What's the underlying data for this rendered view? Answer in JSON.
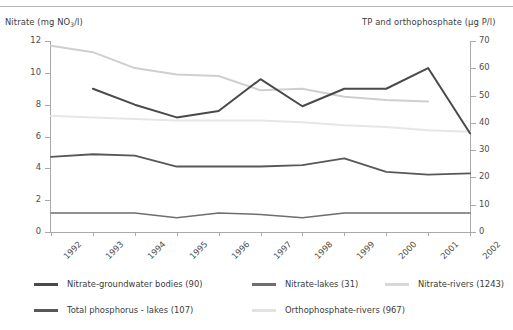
{
  "chart_data": {
    "type": "line",
    "title": "",
    "xlabel": "",
    "ylabel": "Nitrate (mg NO3/l)",
    "y2label": "TP and orthophosphate (µg P/l)",
    "grid": false,
    "legend_position": "bottom",
    "x": [
      1992,
      1993,
      1994,
      1995,
      1996,
      1997,
      1998,
      1999,
      2000,
      2001,
      2002
    ],
    "categories": [
      "1992",
      "1993",
      "1994",
      "1995",
      "1996",
      "1997",
      "1998",
      "1999",
      "2000",
      "2001",
      "2002"
    ],
    "ylim": [
      0,
      12
    ],
    "yticks": [
      0,
      2,
      4,
      6,
      8,
      10,
      12
    ],
    "yticklabels": [
      "0",
      "2",
      "4",
      "6",
      "8",
      "10",
      "12"
    ],
    "y2lim": [
      0,
      70
    ],
    "y2ticks": [
      0,
      10,
      20,
      30,
      40,
      50,
      60,
      70
    ],
    "y2ticklabels": [
      "0",
      "10",
      "20",
      "30",
      "40",
      "50",
      "60",
      "70"
    ],
    "series": [
      {
        "name": "Nitrate-groundwater bodies (90)",
        "axis": "left",
        "color": "#4a4a4a",
        "width": 2.0,
        "x": [
          1993,
          1994,
          1995,
          1996,
          1997,
          1998,
          1999,
          2000,
          2001,
          2002
        ],
        "values": [
          9.0,
          8.0,
          7.2,
          7.6,
          9.6,
          7.9,
          9.0,
          9.0,
          10.3,
          6.2
        ]
      },
      {
        "name": "Nitrate-lakes (31)",
        "axis": "left",
        "color": "#6e6e6e",
        "width": 1.5,
        "x": [
          1992,
          1993,
          1994,
          1995,
          1996,
          1997,
          1998,
          1999,
          2000,
          2001,
          2002
        ],
        "values": [
          1.2,
          1.2,
          1.2,
          0.9,
          1.2,
          1.1,
          0.9,
          1.2,
          1.2,
          1.2,
          1.2
        ]
      },
      {
        "name": "Nitrate-rivers (1243)",
        "axis": "left",
        "color": "#cfcfcf",
        "width": 2.0,
        "x": [
          1992,
          1993,
          1994,
          1995,
          1996,
          1997,
          1998,
          1999,
          2000,
          2001
        ],
        "values": [
          11.7,
          11.3,
          10.3,
          9.9,
          9.8,
          8.9,
          9.0,
          8.5,
          8.3,
          8.2
        ]
      },
      {
        "name": "Total phosphorus - lakes (107)",
        "axis": "right",
        "color": "#585858",
        "width": 1.8,
        "x": [
          1992,
          1993,
          1994,
          1995,
          1996,
          1997,
          1998,
          1999,
          2000,
          2001,
          2002
        ],
        "values": [
          27.5,
          28.5,
          28.0,
          24.0,
          24.0,
          24.0,
          24.5,
          27.0,
          22.0,
          21.0,
          21.5
        ]
      },
      {
        "name": "Orthophosphate-rivers (967)",
        "axis": "left",
        "color": "#e6e6e6",
        "width": 2.0,
        "x": [
          1992,
          1993,
          1994,
          1995,
          1996,
          1997,
          1998,
          1999,
          2000,
          2001,
          2002
        ],
        "values": [
          7.3,
          7.2,
          7.1,
          7.0,
          7.0,
          7.0,
          6.9,
          6.7,
          6.6,
          6.4,
          6.3
        ]
      }
    ]
  },
  "axes": {
    "left_title_pre": "Nitrate (mg NO",
    "left_title_sub": "3",
    "left_title_post": "/l)",
    "right_title": "TP and orthophosphate (µg P/l)"
  },
  "legend": {
    "items": [
      {
        "label": "Nitrate-groundwater bodies (90)",
        "color": "#4a4a4a"
      },
      {
        "label": "Nitrate-lakes (31)",
        "color": "#6e6e6e"
      },
      {
        "label": "Nitrate-rivers (1243)",
        "color": "#d8d8d8"
      },
      {
        "label": "Total phosphorus - lakes (107)",
        "color": "#585858"
      },
      {
        "label": "Orthophosphate-rivers (967)",
        "color": "#e2e2e2"
      }
    ]
  }
}
